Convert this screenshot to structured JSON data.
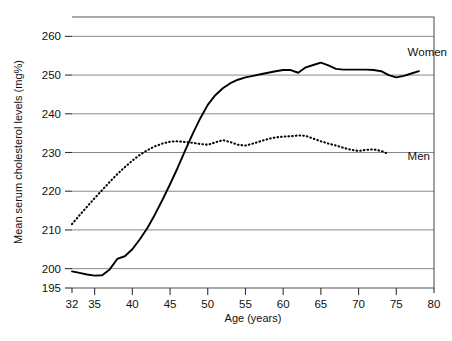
{
  "chart_data": {
    "type": "line",
    "title": "",
    "xlabel": "Age (years)",
    "ylabel": "Mean serum cholesterol levels (mg%)",
    "xlim": [
      32,
      80
    ],
    "ylim": [
      195,
      265
    ],
    "xticks": [
      32,
      35,
      40,
      45,
      50,
      55,
      60,
      65,
      70,
      75,
      80
    ],
    "yticks": [
      195,
      200,
      210,
      220,
      230,
      240,
      250,
      260
    ],
    "xtick_labels": [
      "32",
      "35",
      "40",
      "45",
      "50",
      "55",
      "60",
      "65",
      "70",
      "75",
      "80"
    ],
    "ytick_labels": [
      "195",
      "200",
      "210",
      "220",
      "230",
      "240",
      "250",
      "260"
    ],
    "gridlines": [
      200,
      210,
      220,
      230,
      240,
      250,
      260
    ],
    "grid": true,
    "legend_position": "inline-right",
    "series": [
      {
        "name": "Women",
        "style": "solid",
        "color": "#000000",
        "label": "Women",
        "x": [
          32,
          33,
          34,
          35,
          36,
          37,
          38,
          39,
          40,
          41,
          42,
          43,
          44,
          45,
          46,
          47,
          48,
          49,
          50,
          51,
          52,
          53,
          54,
          55,
          56,
          57,
          58,
          59,
          60,
          61,
          62,
          63,
          64,
          65,
          66,
          67,
          68,
          69,
          70,
          71,
          72,
          73,
          74,
          75,
          76,
          77,
          78
        ],
        "values": [
          199.3,
          198.9,
          198.5,
          198.2,
          198.3,
          199.8,
          202.5,
          203.2,
          205.0,
          207.6,
          210.5,
          214.0,
          217.8,
          221.8,
          226.0,
          230.5,
          234.8,
          238.8,
          242.3,
          244.8,
          246.6,
          247.9,
          248.8,
          249.4,
          249.8,
          250.2,
          250.6,
          251.0,
          251.3,
          251.3,
          250.6,
          252.0,
          252.6,
          253.2,
          252.5,
          251.6,
          251.4,
          251.4,
          251.4,
          251.4,
          251.3,
          251.0,
          250.0,
          249.4,
          249.8,
          250.4,
          251.0
        ]
      },
      {
        "name": "Men",
        "style": "dotted",
        "color": "#000000",
        "label": "Men",
        "x": [
          32,
          33,
          34,
          35,
          36,
          37,
          38,
          39,
          40,
          41,
          42,
          43,
          44,
          45,
          46,
          47,
          48,
          49,
          50,
          51,
          52,
          53,
          54,
          55,
          56,
          57,
          58,
          59,
          60,
          61,
          62,
          63,
          64,
          65,
          66,
          67,
          68,
          69,
          70,
          71,
          72,
          73,
          74
        ],
        "values": [
          211.5,
          213.8,
          216.0,
          218.2,
          220.3,
          222.4,
          224.4,
          226.2,
          227.9,
          229.4,
          230.6,
          231.6,
          232.3,
          232.8,
          232.9,
          232.7,
          232.5,
          232.2,
          232.0,
          232.6,
          233.2,
          232.7,
          232.0,
          231.8,
          232.3,
          232.9,
          233.5,
          233.9,
          234.1,
          234.2,
          234.4,
          234.3,
          233.6,
          232.9,
          232.3,
          231.8,
          231.2,
          230.7,
          230.4,
          230.7,
          230.8,
          230.4,
          229.6
        ]
      }
    ],
    "series_labels": [
      {
        "text": "Women",
        "x": 76.5,
        "y": 256.0
      },
      {
        "text": "Men",
        "x": 76.5,
        "y": 229.0
      }
    ]
  }
}
